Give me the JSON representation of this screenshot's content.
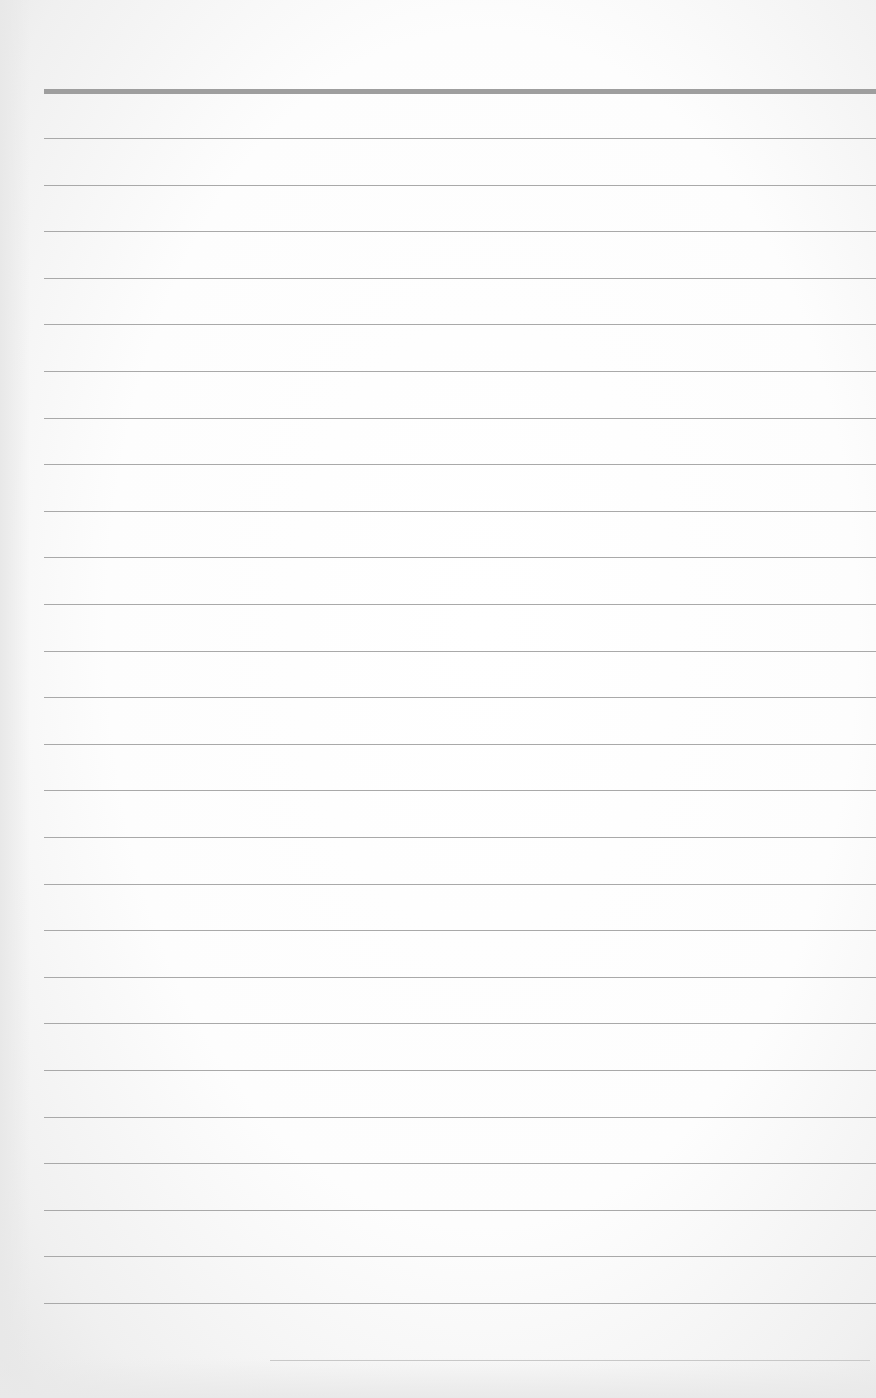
{
  "page": {
    "type": "blank lined notebook paper",
    "header_rule": {
      "y": 89,
      "color": "#9e9e9e"
    },
    "rules": {
      "count": 26,
      "first_y": 138,
      "spacing": 46.6,
      "color": "#a9a9a9"
    },
    "footer_rule": {
      "y": 1360,
      "x": 270,
      "width": 600,
      "color": "#c8c8c8"
    }
  }
}
